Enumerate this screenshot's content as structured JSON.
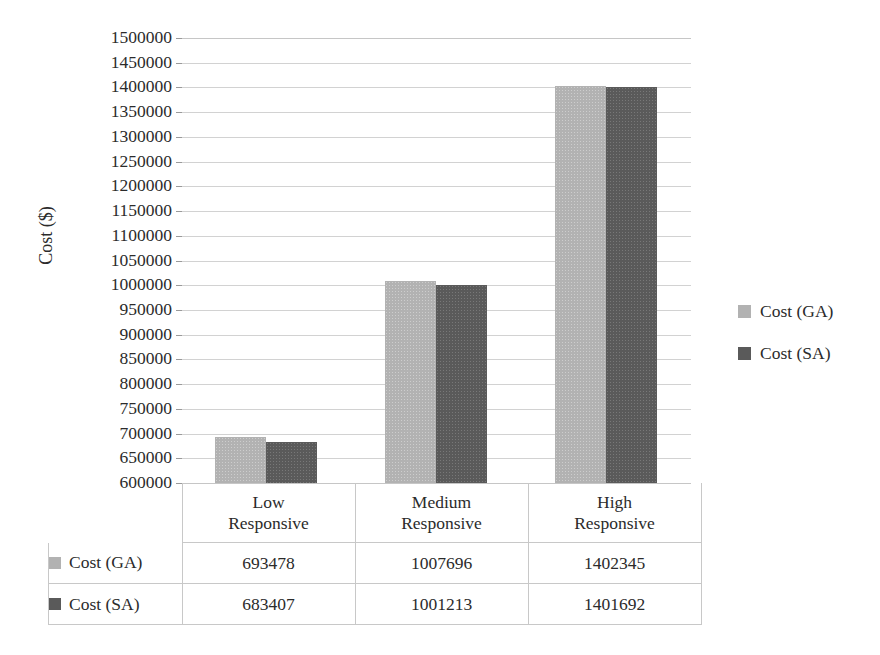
{
  "chart_data": {
    "type": "bar",
    "title": "",
    "subtitle": "",
    "xlabel": "",
    "ylabel": "Cost ($)",
    "ylim": [
      600000,
      1500000
    ],
    "ytick_step": 50000,
    "grid": true,
    "legend_position": "right",
    "categories": [
      "Low Responsive",
      "Medium Responsive",
      "High Responsive"
    ],
    "category_lines": [
      [
        "Low",
        "Responsive"
      ],
      [
        "Medium",
        "Responsive"
      ],
      [
        "High",
        "Responsive"
      ]
    ],
    "series": [
      {
        "name": "Cost (GA)",
        "color": "#b2b2b2",
        "values": [
          693478,
          1007696,
          1402345
        ]
      },
      {
        "name": "Cost (SA)",
        "color": "#5a5a5a",
        "values": [
          683407,
          1001213,
          1401692
        ]
      }
    ],
    "ytick_labels": [
      "1500000",
      "1450000",
      "1400000",
      "1350000",
      "1300000",
      "1250000",
      "1200000",
      "1150000",
      "1100000",
      "1050000",
      "1000000",
      "950000",
      "900000",
      "850000",
      "800000",
      "750000",
      "700000",
      "650000",
      "600000"
    ],
    "ytick_values": [
      1500000,
      1450000,
      1400000,
      1350000,
      1300000,
      1250000,
      1200000,
      1150000,
      1100000,
      1050000,
      1000000,
      950000,
      900000,
      850000,
      800000,
      750000,
      700000,
      650000,
      600000
    ]
  },
  "legend": {
    "items": [
      {
        "label": "Cost (GA)",
        "color": "#b2b2b2"
      },
      {
        "label": "Cost (SA)",
        "color": "#5a5a5a"
      }
    ]
  },
  "data_table": {
    "row_headers": [
      "Cost (GA)",
      "Cost (SA)"
    ],
    "column_headers": [
      "Low Responsive",
      "Medium Responsive",
      "High Responsive"
    ],
    "rows": [
      {
        "label": "Cost (GA)",
        "color": "#b2b2b2",
        "cells": [
          "693478",
          "1007696",
          "1402345"
        ]
      },
      {
        "label": "Cost (SA)",
        "color": "#5a5a5a",
        "cells": [
          "683407",
          "1001213",
          "1401692"
        ]
      }
    ]
  },
  "axis": {
    "y_title": "Cost ($)"
  }
}
